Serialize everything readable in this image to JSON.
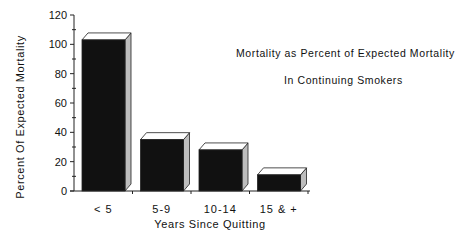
{
  "chart_data": {
    "type": "bar",
    "title_lines": [
      "Mortality as Percent of Expected Mortality",
      "In Continuing Smokers"
    ],
    "xlabel": "Years Since Quitting",
    "ylabel": "Percent Of Expected Mortality",
    "categories": [
      "< 5",
      "5-9",
      "10-14",
      "15 & +"
    ],
    "values": [
      103,
      35,
      28,
      11
    ],
    "ylim": [
      0,
      120
    ],
    "yticks": [
      0,
      20,
      40,
      60,
      80,
      100,
      120
    ],
    "grid": false,
    "legend": null,
    "style": "3d-bars",
    "bar_color": "#111111",
    "bar_side_color": "#bdbdbd",
    "bar_top_color": "#ffffff"
  },
  "labels": {
    "ylabel": "Percent Of Expected Mortality",
    "xlabel": "Years Since Quitting",
    "title_line1": "Mortality as Percent of Expected Mortality",
    "title_line2": "In Continuing Smokers"
  }
}
